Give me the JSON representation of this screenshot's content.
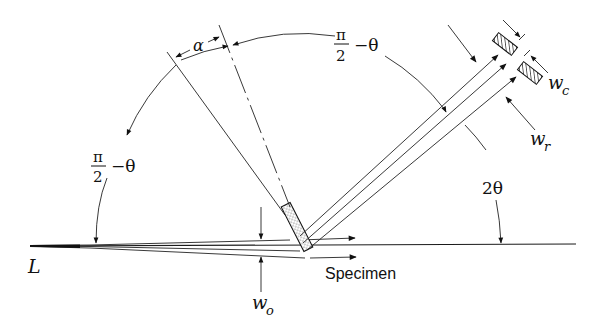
{
  "figure": {
    "type": "schematic",
    "labels": {
      "source": "L",
      "specimen": "Specimen",
      "alpha": "α",
      "pi": "π",
      "two": "2",
      "minus_theta": "−θ",
      "two_theta": "2θ",
      "w_o": "w",
      "w_o_sub": "o",
      "w_c": "w",
      "w_c_sub": "c",
      "w_r": "w",
      "w_r_sub": "r"
    },
    "annotations": [
      {
        "id": "alpha",
        "text": "α",
        "meaning": "divergence angle at specimen"
      },
      {
        "id": "angle-left",
        "text": "π/2 − θ",
        "meaning": "angle between incident beam and specimen normal"
      },
      {
        "id": "angle-top",
        "text": "π/2 − θ",
        "meaning": "angle between specimen normal and diffracted beam"
      },
      {
        "id": "two-theta",
        "text": "2θ",
        "meaning": "diffraction angle"
      },
      {
        "id": "w_o",
        "text": "w_o",
        "meaning": "incident beam width"
      },
      {
        "id": "w_c",
        "text": "w_c",
        "meaning": "collimator slit width"
      },
      {
        "id": "w_r",
        "text": "w_r",
        "meaning": "receiving beam width"
      }
    ]
  }
}
